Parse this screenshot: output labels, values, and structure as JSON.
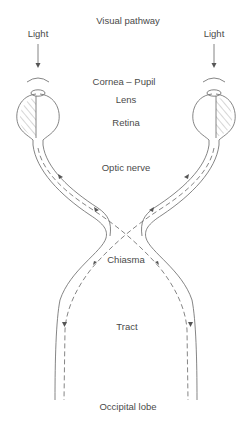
{
  "title": "Visual pathway",
  "labels": {
    "light_left": "Light",
    "light_right": "Light",
    "cornea_pupil": "Cornea – Pupil",
    "lens": "Lens",
    "retina": "Retina",
    "optic_nerve": "Optic nerve",
    "chiasma": "Chiasma",
    "tract": "Tract",
    "occipital_lobe": "Occipital lobe"
  },
  "colors": {
    "line": "#6a6a6a",
    "text": "#4a4a4a",
    "background": "#ffffff"
  }
}
